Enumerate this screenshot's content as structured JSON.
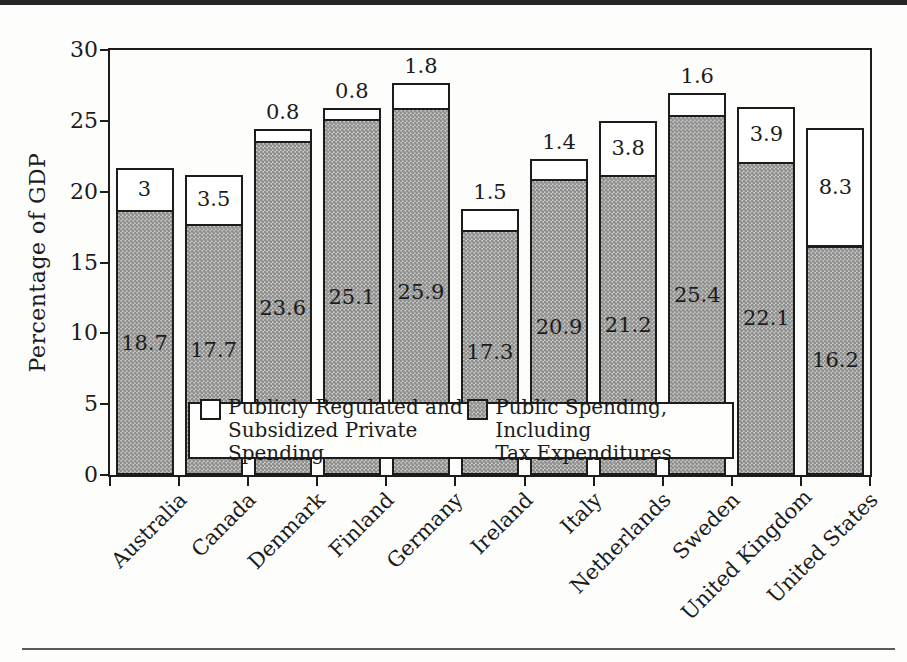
{
  "figure": {
    "ylabel": "Percentage of GDP"
  },
  "chart_data": {
    "type": "bar",
    "stacked": true,
    "title": "",
    "xlabel": "",
    "ylabel": "Percentage of GDP",
    "ylim": [
      0,
      30
    ],
    "yticks": [
      0,
      5,
      10,
      15,
      20,
      25,
      30
    ],
    "grid": false,
    "legend_position": "inside-bottom",
    "categories": [
      "Australia",
      "Canada",
      "Denmark",
      "Finland",
      "Germany",
      "Ireland",
      "Italy",
      "Netherlands",
      "Sweden",
      "United Kingdom",
      "United States"
    ],
    "series": [
      {
        "name": "Public Spending, Including Tax Expenditures",
        "color": "#b7b6b4",
        "values": [
          18.7,
          17.7,
          23.6,
          25.1,
          25.9,
          17.3,
          20.9,
          21.2,
          25.4,
          22.1,
          16.2
        ]
      },
      {
        "name": "Publicly Regulated and Subsidized Private Spending",
        "color": "#ffffff",
        "values": [
          3,
          3.5,
          0.8,
          0.8,
          1.8,
          1.5,
          1.4,
          3.8,
          1.6,
          3.9,
          8.3
        ]
      }
    ],
    "legend": [
      {
        "line1": "Publicly Regulated and",
        "line2": "Subsidized Private Spending",
        "swatch": "white"
      },
      {
        "line1": "Public Spending, Including",
        "line2": "Tax Expenditures",
        "swatch": "gray"
      }
    ]
  }
}
